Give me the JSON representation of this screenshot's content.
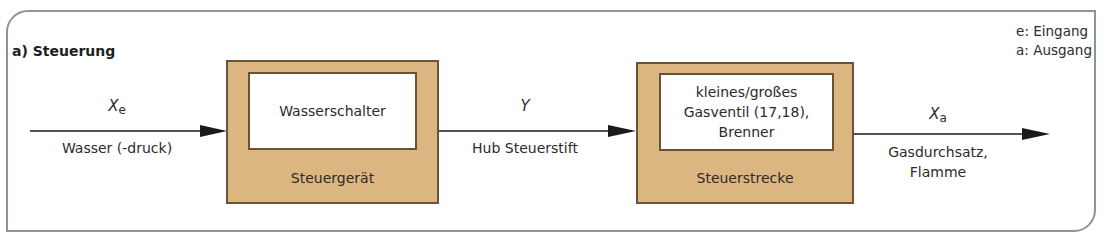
{
  "title": "a) Steuerung",
  "legend": [
    "e: Eingang",
    "a: Ausgang"
  ],
  "colors": {
    "block_fill": "#dcb680",
    "block_border": "#6b5234",
    "frame_border": "#8a9690",
    "arrow": "#1a1a1a"
  },
  "blocks": [
    {
      "inner_lines": [
        "Wasserschalter"
      ],
      "label": "Steuergerät"
    },
    {
      "inner_lines": [
        "kleines/großes",
        "Gasventil (17,18),",
        "Brenner"
      ],
      "label": "Steuerstrecke"
    }
  ],
  "signals": [
    {
      "symbol": "X",
      "subscript": "e",
      "description_lines": [
        "Wasser (-druck)"
      ]
    },
    {
      "symbol": "Y",
      "subscript": "",
      "description_lines": [
        "Hub Steuerstift"
      ]
    },
    {
      "symbol": "X",
      "subscript": "a",
      "description_lines": [
        "Gasdurchsatz,",
        "Flamme"
      ]
    }
  ]
}
